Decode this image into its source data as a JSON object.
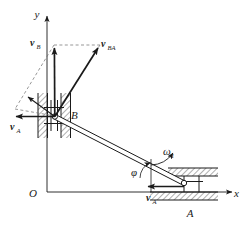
{
  "figure": {
    "background_color": "#ffffff",
    "line_color": "#1a1a1a",
    "dashed_color": "#6b6b6b"
  },
  "axes": {
    "y_label": "y",
    "x_label": "x",
    "origin_label": "O"
  },
  "points": {
    "a_label": "A",
    "b_label": "B"
  },
  "angle": {
    "phi_label": "φ"
  },
  "rotation": {
    "omega_label": "ω",
    "omega_subscript": "1"
  },
  "vectors": [
    {
      "id": "v-b",
      "name": "v",
      "subscript": "B",
      "description": "velocity of slider B, directed vertically upward"
    },
    {
      "id": "v-ba",
      "name": "v",
      "subscript": "BA",
      "description": "relative velocity of B with respect to A, perpendicular to rod AB"
    },
    {
      "id": "v-a-at-b",
      "name": "v",
      "subscript": "A",
      "description": "transport velocity of A applied at B, directed horizontally left"
    },
    {
      "id": "v-a-at-a",
      "name": "v",
      "subscript": "A",
      "description": "velocity of slider A, directed horizontally left along the x guide"
    }
  ]
}
